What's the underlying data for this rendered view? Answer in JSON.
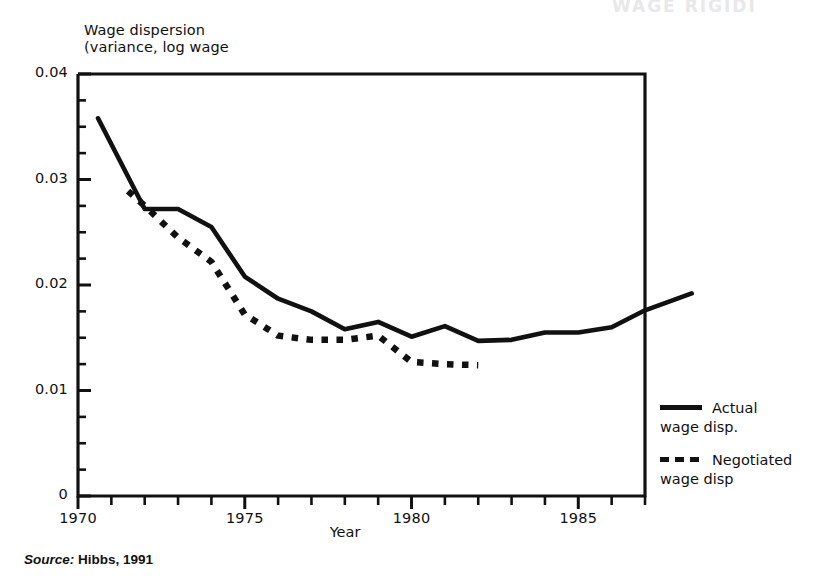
{
  "figure": {
    "bleed_text": "WAGE RIGIDI",
    "source_label": "Source:",
    "source_value": "Hibbs, 1991"
  },
  "chart_data": {
    "type": "line",
    "title": "",
    "ylabel_line1": "Wage dispersion",
    "ylabel_line2": "(variance, log wage",
    "xlabel": "Year",
    "xlim": [
      1970,
      1987
    ],
    "ylim": [
      0,
      0.04
    ],
    "grid": false,
    "legend_position": "right",
    "y_ticks": [
      "0",
      "0.01",
      "0.02",
      "0.03",
      "0.04"
    ],
    "y_tick_values": [
      0,
      0.01,
      0.02,
      0.03,
      0.04
    ],
    "y_minor_tick_step": 0.0025,
    "x_ticks": [
      "1970",
      "1975",
      "1980",
      "1985"
    ],
    "x_tick_values": [
      1970,
      1975,
      1980,
      1985
    ],
    "x_minor_tick_step": 1,
    "series": [
      {
        "name": "Negotiated wage disp",
        "legend_label": "Negotiated\nwage disp",
        "style": "dashed",
        "color": "#111111",
        "x": [
          1971.5,
          1972,
          1973,
          1974,
          1975,
          1976,
          1977,
          1978,
          1979,
          1980,
          1981,
          1982
        ],
        "values": [
          0.0289,
          0.0275,
          0.0245,
          0.0222,
          0.0172,
          0.0152,
          0.0148,
          0.0148,
          0.0152,
          0.0127,
          0.0125,
          0.0124
        ]
      },
      {
        "name": "Actual wage disp.",
        "legend_label": "Actual\nwage disp.",
        "style": "solid",
        "color": "#111111",
        "x": [
          1970.6,
          1972,
          1973,
          1974,
          1975,
          1976,
          1977,
          1978,
          1979,
          1980,
          1981,
          1982,
          1983,
          1984,
          1985,
          1986,
          1987,
          1988.4
        ],
        "values": [
          0.0358,
          0.0272,
          0.0272,
          0.0255,
          0.0208,
          0.0187,
          0.0175,
          0.0158,
          0.0165,
          0.0151,
          0.0161,
          0.0147,
          0.0148,
          0.0155,
          0.0155,
          0.016,
          0.0176,
          0.0192
        ]
      }
    ]
  }
}
